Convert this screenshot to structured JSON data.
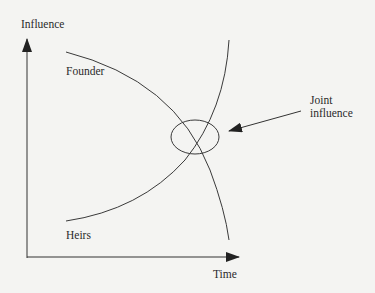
{
  "diagram": {
    "y_axis_label": "Influence",
    "x_axis_label": "Time",
    "curves": [
      {
        "name": "Founder",
        "trend": "decreasing"
      },
      {
        "name": "Heirs",
        "trend": "increasing"
      }
    ],
    "annotation": {
      "line1": "Joint",
      "line2": "influence"
    },
    "colors": {
      "stroke": "#3a3a3a",
      "background": "#f4f4f2"
    }
  }
}
